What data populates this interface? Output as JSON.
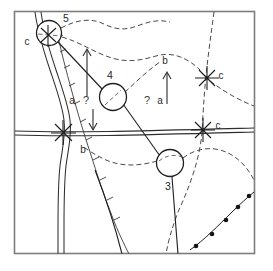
{
  "figure": {
    "kind": "geologic-sketch-map",
    "width": 273,
    "height": 271,
    "background_color": "#ffffff",
    "frame_color": "#7d7d7d"
  },
  "colors": {
    "ink": "#1f1f1f",
    "line": "#2e2e2e",
    "dashed": "#4a4a4a",
    "frame": "#7d7d7d"
  },
  "sites": [
    {
      "id": "site-5",
      "label": "5",
      "cx": 49,
      "cy": 33,
      "r": 12.5,
      "label_x": 66,
      "label_y": 19
    },
    {
      "id": "site-4",
      "label": "4",
      "cx": 113,
      "cy": 97,
      "r": 13.5,
      "label_x": 110,
      "label_y": 78
    },
    {
      "id": "site-3",
      "label": "3",
      "cx": 170,
      "cy": 163,
      "r": 13.5,
      "label_x": 168,
      "label_y": 189
    }
  ],
  "markers": [
    {
      "id": "marker-c-top-left",
      "label": "c",
      "x": 48,
      "y": 36,
      "label_x": 27,
      "label_y": 42
    },
    {
      "id": "marker-b-left-crossing",
      "label": "b",
      "x": 63,
      "y": 132,
      "label_x": 82,
      "label_y": 150
    },
    {
      "id": "marker-c-right-upper",
      "label": "c",
      "x": 207,
      "y": 78,
      "label_x": 219,
      "label_y": 76
    },
    {
      "id": "marker-c-right-lower",
      "label": "c",
      "x": 203,
      "y": 130,
      "label_x": 216,
      "label_y": 126
    }
  ],
  "unit_labels": [
    {
      "id": "unit-b-upper-right",
      "text": "b",
      "x": 165,
      "y": 61
    }
  ],
  "annotations": [
    {
      "id": "annotation-a-left",
      "text": "a",
      "x": 72,
      "y": 101
    },
    {
      "id": "annotation-q-left",
      "text": "?",
      "x": 85,
      "y": 101
    },
    {
      "id": "annotation-q-right",
      "text": "?",
      "x": 146,
      "y": 101
    },
    {
      "id": "annotation-a-right",
      "text": "a",
      "x": 160,
      "y": 101
    }
  ],
  "arrows": [
    {
      "id": "arrow-up-left",
      "x1": 87,
      "y1": 96,
      "x2": 87,
      "y2": 50,
      "direction": "up"
    },
    {
      "id": "arrow-down-left",
      "x1": 93,
      "y1": 109,
      "x2": 93,
      "y2": 129,
      "direction": "down"
    },
    {
      "id": "arrow-up-right",
      "x1": 167,
      "y1": 104,
      "x2": 167,
      "y2": 73,
      "direction": "up"
    }
  ],
  "legend_features": [
    "circled-numbered-sample-sites",
    "solid-road-double-line",
    "meandering-river-double-line",
    "dashed-geologic-contacts",
    "star-markers-labeled-c",
    "dotted-bead-line-lower-right",
    "tick-marked-contact-along-river"
  ]
}
